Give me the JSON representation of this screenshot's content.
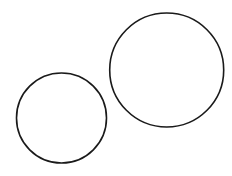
{
  "canvas": {
    "width": 232,
    "height": 176,
    "background": "#ffffff"
  },
  "style": {
    "stroke": "#1a1a1a",
    "stroke_width": 1.6,
    "fill": "none"
  },
  "shapes": [
    {
      "type": "circle",
      "name": "small-circle",
      "cx": 61.5,
      "cy": 118,
      "r": 45
    },
    {
      "type": "circle",
      "name": "large-circle",
      "cx": 166.7,
      "cy": 70,
      "r": 57
    }
  ]
}
